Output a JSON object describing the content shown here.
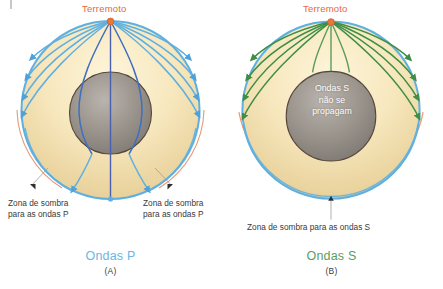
{
  "figure": {
    "title_hidden": "",
    "panels": [
      {
        "id": "A",
        "letter": "(A)",
        "wave_caption": "Ondas P",
        "wave_color": "#6cb6e0",
        "source_label": "Terremoto",
        "source_color": "#e8663c",
        "shadow_label_left": "Zona de sombra\npara as ondas P",
        "shadow_label_right": "Zona de sombra\npara as ondas P",
        "core_label": "",
        "ray_color": "#5fb0e0",
        "core_ray_color": "#3f51a8",
        "shadow_arc_color": "#e8916d"
      },
      {
        "id": "B",
        "letter": "(B)",
        "wave_caption": "Ondas S",
        "wave_color": "#5a9e5f",
        "source_label": "Terremoto",
        "source_color": "#e8663c",
        "shadow_label_bottom": "Zona de sombra para as ondas S",
        "core_label": "Ondas S\nnão se\npropagam",
        "ray_color": "#3e8f45",
        "shadow_arc_color": "#e8916d"
      }
    ],
    "colors": {
      "mantle_light": "#f7e7bd",
      "mantle_deep": "#e6cf97",
      "core_gray": "#8f8a84",
      "surface_blue": "#5fb0e0",
      "core_outline": "#4a4036",
      "background": "#ffffff"
    }
  }
}
